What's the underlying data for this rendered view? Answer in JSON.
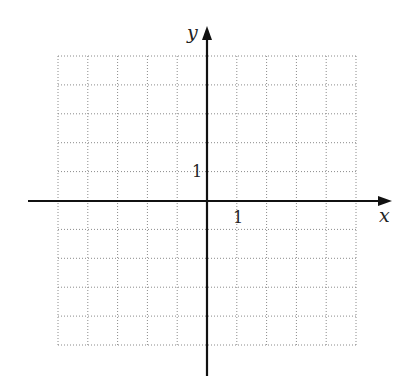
{
  "chart_data": {
    "type": "coordinate-grid",
    "title": "",
    "xlabel": "x",
    "ylabel": "y",
    "xlim": [
      -5,
      5
    ],
    "ylim": [
      -5,
      5
    ],
    "grid": true,
    "grid_style": "dotted",
    "grid_step": 1,
    "tick_labels": [
      {
        "axis": "x",
        "value": 1,
        "label": "1"
      },
      {
        "axis": "y",
        "value": 1,
        "label": "1"
      }
    ],
    "series": []
  },
  "labels": {
    "x_axis": "x",
    "y_axis": "y",
    "x_tick_1": "1",
    "y_tick_1": "1"
  },
  "colors": {
    "axis": "#111111",
    "grid": "#8a8a8a",
    "background": "#ffffff"
  }
}
